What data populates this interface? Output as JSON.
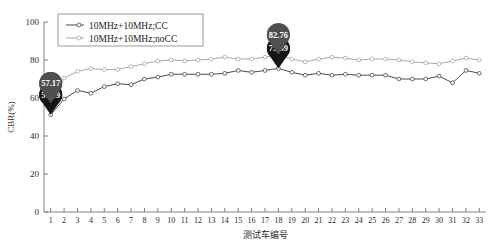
{
  "chart_data": {
    "type": "line",
    "title": "",
    "xlabel": "测试车编号",
    "ylabel": "CBR(%)",
    "xlim": [
      0.5,
      33.5
    ],
    "ylim": [
      0,
      100
    ],
    "yticks": [
      0,
      20,
      40,
      60,
      80,
      100
    ],
    "grid": false,
    "legend_position": "top-left",
    "x": [
      1,
      2,
      3,
      4,
      5,
      6,
      7,
      8,
      9,
      10,
      11,
      12,
      13,
      14,
      15,
      16,
      17,
      18,
      19,
      20,
      21,
      22,
      23,
      24,
      25,
      26,
      27,
      28,
      29,
      30,
      31,
      32,
      33
    ],
    "xticklabels": [
      "1",
      "2",
      "3",
      "4",
      "5",
      "6",
      "7",
      "8",
      "9",
      "10",
      "11",
      "12",
      "13",
      "14",
      "15",
      "16",
      "17",
      "18",
      "19",
      "20",
      "21",
      "22",
      "23",
      "24",
      "25",
      "26",
      "27",
      "28",
      "29",
      "30",
      "31",
      "32",
      "33"
    ],
    "series": [
      {
        "name": "10MHz+10MHz;CC",
        "color": "#4a4a4a",
        "marker": "circle-open",
        "values": [
          51.19,
          59.5,
          64.0,
          62.5,
          66.0,
          67.5,
          67.0,
          70.0,
          71.0,
          72.5,
          72.5,
          72.5,
          72.5,
          73.0,
          74.5,
          73.5,
          74.5,
          75.59,
          73.5,
          72.0,
          73.0,
          72.0,
          72.5,
          72.0,
          72.0,
          72.0,
          70.0,
          70.0,
          70.0,
          71.5,
          68.0,
          74.5,
          73.0
        ]
      },
      {
        "name": "10MHz+10MHz;noCC",
        "color": "#a8a8a8",
        "marker": "circle-open",
        "values": [
          57.17,
          70.5,
          74.0,
          75.5,
          75.0,
          75.0,
          76.5,
          78.0,
          79.5,
          80.0,
          79.5,
          80.0,
          80.5,
          81.5,
          80.5,
          80.5,
          81.5,
          82.76,
          80.5,
          79.0,
          80.5,
          81.5,
          81.0,
          80.0,
          80.5,
          80.5,
          80.0,
          79.0,
          78.5,
          78.0,
          79.5,
          81.0,
          80.0
        ]
      }
    ],
    "annotations": [
      {
        "id": "ann-51-19",
        "label": "51.19",
        "x": 1,
        "y": 51.19,
        "style": "dark",
        "series": "10MHz+10MHz;CC"
      },
      {
        "id": "ann-57-17",
        "label": "57.17",
        "x": 1,
        "y": 57.17,
        "style": "gray",
        "series": "10MHz+10MHz;noCC"
      },
      {
        "id": "ann-75-59",
        "label": "75.59",
        "x": 18,
        "y": 75.59,
        "style": "dark",
        "series": "10MHz+10MHz;CC"
      },
      {
        "id": "ann-82-76",
        "label": "82.76",
        "x": 18,
        "y": 82.76,
        "style": "gray",
        "series": "10MHz+10MHz;noCC"
      }
    ]
  },
  "legend": {
    "items": [
      {
        "label": "10MHz+10MHz;CC",
        "color": "#4a4a4a"
      },
      {
        "label": "10MHz+10MHz;noCC",
        "color": "#a8a8a8"
      }
    ]
  }
}
